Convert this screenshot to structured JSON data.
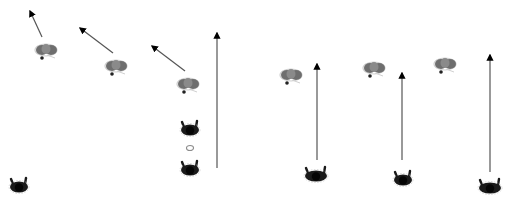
{
  "canvas": {
    "width": 510,
    "height": 205,
    "background": "#ffffff"
  },
  "colors": {
    "arrow": "#555555",
    "arrowhead": "#000000",
    "figure_light_body": "#6e6e6e",
    "figure_light_center": "#8a8a8a",
    "figure_light_edge": "#d0d0d0",
    "figure_dark_body": "#1a1a1a",
    "figure_dark_head": "#050505",
    "figure_dark_edge": "#bdbdbd"
  },
  "figures": [
    {
      "id": "f1",
      "type": "light",
      "x": 46,
      "y": 50
    },
    {
      "id": "f2",
      "type": "light",
      "x": 116,
      "y": 66
    },
    {
      "id": "f3",
      "type": "light",
      "x": 188,
      "y": 84
    },
    {
      "id": "f4",
      "type": "dark",
      "x": 190,
      "y": 130
    },
    {
      "id": "f5",
      "type": "ring",
      "x": 190,
      "y": 148
    },
    {
      "id": "f6",
      "type": "dark",
      "x": 190,
      "y": 170
    },
    {
      "id": "f7",
      "type": "dark",
      "x": 19,
      "y": 187
    },
    {
      "id": "f8",
      "type": "light",
      "x": 291,
      "y": 75
    },
    {
      "id": "f9",
      "type": "light",
      "x": 374,
      "y": 68
    },
    {
      "id": "f10",
      "type": "light",
      "x": 445,
      "y": 64
    },
    {
      "id": "f11",
      "type": "darkwide",
      "x": 316,
      "y": 176
    },
    {
      "id": "f12",
      "type": "dark",
      "x": 403,
      "y": 180
    },
    {
      "id": "f13",
      "type": "darkwide",
      "x": 490,
      "y": 188
    }
  ],
  "arrows": [
    {
      "id": "a1",
      "x1": 42,
      "y1": 37,
      "x2": 30,
      "y2": 11
    },
    {
      "id": "a2",
      "x1": 113,
      "y1": 53,
      "x2": 80,
      "y2": 28
    },
    {
      "id": "a3",
      "x1": 185,
      "y1": 71,
      "x2": 152,
      "y2": 46
    },
    {
      "id": "a4",
      "x1": 217,
      "y1": 168,
      "x2": 217,
      "y2": 33
    },
    {
      "id": "a5",
      "x1": 317,
      "y1": 160,
      "x2": 317,
      "y2": 64
    },
    {
      "id": "a6",
      "x1": 402,
      "y1": 160,
      "x2": 402,
      "y2": 73
    },
    {
      "id": "a7",
      "x1": 490,
      "y1": 172,
      "x2": 490,
      "y2": 55
    }
  ]
}
